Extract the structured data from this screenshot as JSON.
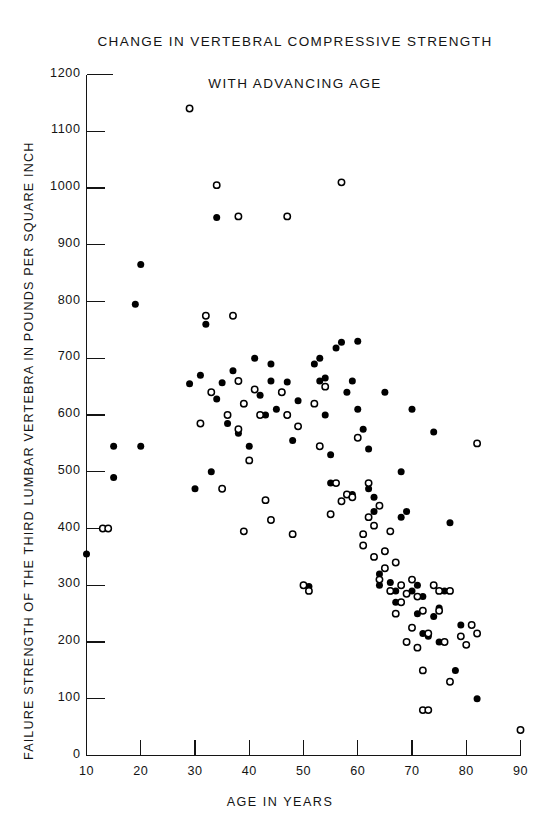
{
  "chart_data": {
    "type": "scatter",
    "title": "CHANGE IN VERTEBRAL COMPRESSIVE STRENGTH WITH ADVANCING AGE",
    "title_lines": [
      "CHANGE IN VERTEBRAL COMPRESSIVE STRENGTH",
      "WITH ADVANCING AGE"
    ],
    "xlabel": "AGE IN YEARS",
    "ylabel": "FAILURE STRENGTH OF THE THIRD LUMBAR VERTEBRA IN POUNDS PER SQUARE INCH",
    "xlim": [
      10,
      90
    ],
    "ylim": [
      0,
      1200
    ],
    "xticks": [
      10,
      20,
      30,
      40,
      50,
      60,
      70,
      80,
      90
    ],
    "yticks": [
      0,
      100,
      200,
      300,
      400,
      500,
      600,
      700,
      800,
      900,
      1000,
      1100,
      1200
    ],
    "grid": false,
    "legend": "none",
    "marker_colors": {
      "filled": "#000000",
      "open": "#000000"
    },
    "series": [
      {
        "name": "filled",
        "marker": "filled-circle",
        "points": [
          [
            10,
            355
          ],
          [
            15,
            490
          ],
          [
            15,
            545
          ],
          [
            20,
            545
          ],
          [
            20,
            865
          ],
          [
            19,
            795
          ],
          [
            29,
            655
          ],
          [
            30,
            470
          ],
          [
            31,
            670
          ],
          [
            32,
            760
          ],
          [
            33,
            500
          ],
          [
            34,
            948
          ],
          [
            34,
            628
          ],
          [
            35,
            657
          ],
          [
            36,
            585
          ],
          [
            37,
            678
          ],
          [
            38,
            568
          ],
          [
            39,
            620
          ],
          [
            40,
            545
          ],
          [
            41,
            700
          ],
          [
            42,
            635
          ],
          [
            43,
            600
          ],
          [
            44,
            660
          ],
          [
            44,
            690
          ],
          [
            45,
            610
          ],
          [
            46,
            640
          ],
          [
            47,
            658
          ],
          [
            47,
            600
          ],
          [
            48,
            555
          ],
          [
            49,
            625
          ],
          [
            50,
            300
          ],
          [
            51,
            298
          ],
          [
            52,
            690
          ],
          [
            53,
            700
          ],
          [
            53,
            660
          ],
          [
            54,
            665
          ],
          [
            54,
            600
          ],
          [
            55,
            480
          ],
          [
            55,
            530
          ],
          [
            56,
            718
          ],
          [
            57,
            728
          ],
          [
            58,
            640
          ],
          [
            59,
            660
          ],
          [
            59,
            460
          ],
          [
            60,
            730
          ],
          [
            60,
            610
          ],
          [
            61,
            575
          ],
          [
            62,
            540
          ],
          [
            62,
            470
          ],
          [
            63,
            455
          ],
          [
            63,
            430
          ],
          [
            64,
            320
          ],
          [
            64,
            300
          ],
          [
            65,
            640
          ],
          [
            65,
            360
          ],
          [
            66,
            305
          ],
          [
            66,
            290
          ],
          [
            67,
            290
          ],
          [
            67,
            270
          ],
          [
            68,
            420
          ],
          [
            68,
            500
          ],
          [
            69,
            430
          ],
          [
            70,
            610
          ],
          [
            70,
            290
          ],
          [
            71,
            300
          ],
          [
            71,
            250
          ],
          [
            72,
            280
          ],
          [
            72,
            215
          ],
          [
            73,
            210
          ],
          [
            74,
            570
          ],
          [
            74,
            245
          ],
          [
            75,
            260
          ],
          [
            75,
            200
          ],
          [
            76,
            290
          ],
          [
            77,
            410
          ],
          [
            78,
            150
          ],
          [
            79,
            230
          ],
          [
            82,
            100
          ]
        ]
      },
      {
        "name": "open",
        "marker": "open-circle",
        "points": [
          [
            13,
            400
          ],
          [
            14,
            400
          ],
          [
            29,
            1140
          ],
          [
            31,
            585
          ],
          [
            32,
            775
          ],
          [
            33,
            640
          ],
          [
            34,
            1005
          ],
          [
            35,
            470
          ],
          [
            36,
            600
          ],
          [
            37,
            775
          ],
          [
            38,
            950
          ],
          [
            38,
            660
          ],
          [
            38,
            575
          ],
          [
            39,
            620
          ],
          [
            39,
            395
          ],
          [
            40,
            520
          ],
          [
            41,
            645
          ],
          [
            42,
            600
          ],
          [
            43,
            450
          ],
          [
            44,
            415
          ],
          [
            46,
            640
          ],
          [
            47,
            950
          ],
          [
            47,
            600
          ],
          [
            48,
            390
          ],
          [
            49,
            580
          ],
          [
            50,
            300
          ],
          [
            51,
            290
          ],
          [
            52,
            620
          ],
          [
            53,
            545
          ],
          [
            54,
            650
          ],
          [
            55,
            425
          ],
          [
            56,
            480
          ],
          [
            57,
            1010
          ],
          [
            57,
            448
          ],
          [
            58,
            460
          ],
          [
            59,
            455
          ],
          [
            60,
            560
          ],
          [
            61,
            390
          ],
          [
            61,
            370
          ],
          [
            62,
            480
          ],
          [
            62,
            420
          ],
          [
            63,
            405
          ],
          [
            63,
            350
          ],
          [
            64,
            440
          ],
          [
            64,
            310
          ],
          [
            65,
            360
          ],
          [
            65,
            330
          ],
          [
            66,
            395
          ],
          [
            66,
            290
          ],
          [
            67,
            340
          ],
          [
            67,
            250
          ],
          [
            68,
            300
          ],
          [
            68,
            270
          ],
          [
            69,
            285
          ],
          [
            69,
            200
          ],
          [
            70,
            310
          ],
          [
            70,
            225
          ],
          [
            71,
            280
          ],
          [
            71,
            190
          ],
          [
            72,
            255
          ],
          [
            72,
            150
          ],
          [
            72,
            80
          ],
          [
            73,
            80
          ],
          [
            73,
            215
          ],
          [
            74,
            300
          ],
          [
            75,
            290
          ],
          [
            75,
            255
          ],
          [
            76,
            200
          ],
          [
            77,
            290
          ],
          [
            77,
            130
          ],
          [
            79,
            210
          ],
          [
            80,
            195
          ],
          [
            81,
            230
          ],
          [
            82,
            550
          ],
          [
            82,
            215
          ],
          [
            90,
            45
          ]
        ]
      }
    ]
  }
}
